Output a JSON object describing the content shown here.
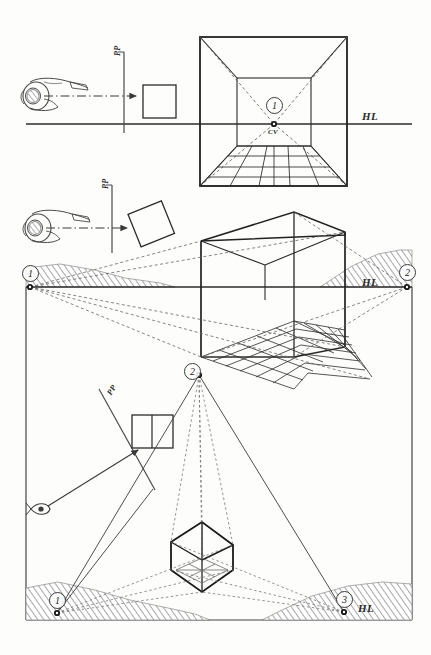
{
  "figure": {
    "type": "technical-illustration",
    "ink_color": "#2b2b2b",
    "paper_color": "#fdfdfc",
    "hatch_color": "#777777"
  },
  "panels": [
    {
      "id": "one-point",
      "name": "one-point-perspective",
      "caption": "",
      "observer": {
        "name": "observer-head-plan",
        "sight_line": "horizontal-dash-dot"
      },
      "picture_plane": {
        "label": "PP",
        "orientation": "vertical",
        "relation": "perpendicular-to-sight-line"
      },
      "object": {
        "name": "square-plan",
        "rotation_deg": 0
      },
      "horizon": {
        "label": "HL"
      },
      "vanishing_points": [
        {
          "number": "1",
          "label": "CV",
          "role": "center-of-vision"
        }
      ],
      "drawing": {
        "name": "interior-room-one-point",
        "floor": "grid",
        "walls": 4
      }
    },
    {
      "id": "two-point",
      "name": "two-point-perspective",
      "caption": "",
      "observer": {
        "name": "observer-head-plan",
        "sight_line": "horizontal-dash-dot"
      },
      "picture_plane": {
        "label": "PP",
        "orientation": "vertical",
        "relation": "object-rotated-to-plane"
      },
      "object": {
        "name": "square-plan-rotated",
        "rotation_deg": 20
      },
      "horizon": {
        "label": "HL"
      },
      "vanishing_points": [
        {
          "number": "1",
          "label": "",
          "role": "left-vanishing-point"
        },
        {
          "number": "2",
          "label": "",
          "role": "right-vanishing-point"
        }
      ],
      "drawing": {
        "name": "interior-corner-two-point",
        "floor": "grid",
        "walls": 2
      }
    },
    {
      "id": "three-point",
      "name": "three-point-perspective",
      "caption": "",
      "observer": {
        "name": "eye-symbol",
        "sight_line": "tilted-arrow"
      },
      "picture_plane": {
        "label": "PP",
        "orientation": "tilted",
        "relation": "inclined-to-sight-line"
      },
      "object": {
        "name": "divided-rectangle-plan",
        "divisions": 2
      },
      "horizon": {
        "label": "HL"
      },
      "vanishing_points": [
        {
          "number": "1",
          "label": "",
          "role": "lower-left-vanishing-point"
        },
        {
          "number": "2",
          "label": "",
          "role": "upper-vertical-vanishing-point"
        },
        {
          "number": "3",
          "label": "",
          "role": "lower-right-vanishing-point"
        }
      ],
      "drawing": {
        "name": "cube-three-point",
        "floor": "grid-underside",
        "walls": 3
      }
    }
  ],
  "labels": {
    "hl_top": "HL",
    "hl_middle": "HL",
    "hl_bottom": "HL",
    "cv": "CV",
    "pp_top": "PP",
    "pp_middle": "PP",
    "pp_bottom": "PP",
    "vp_1a": "1",
    "vp_1b": "1",
    "vp_2b": "2",
    "vp_1c": "1",
    "vp_2c": "2",
    "vp_3c": "3"
  }
}
